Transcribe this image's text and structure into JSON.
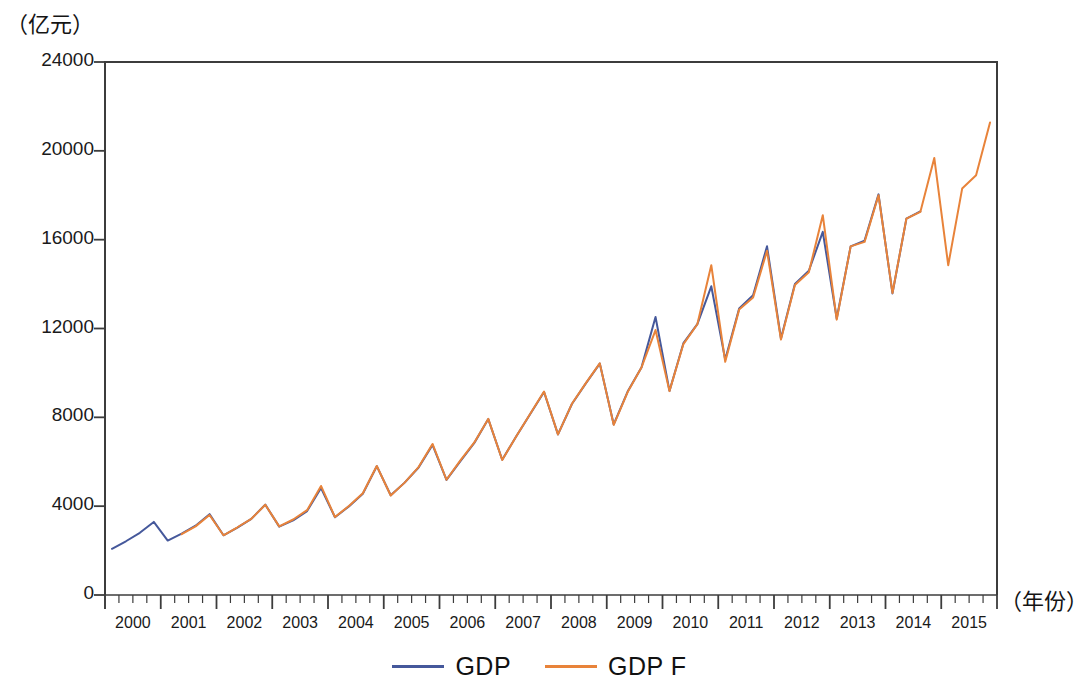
{
  "chart_data": {
    "type": "line",
    "title": "",
    "subtitle": "",
    "ylabel": "（亿元）",
    "xlabel": "（年份）",
    "ylim": [
      0,
      24000
    ],
    "yticks": [
      0,
      4000,
      8000,
      12000,
      16000,
      20000,
      24000
    ],
    "ytick_labels": [
      "0",
      "4000",
      "8000",
      "12000",
      "16000",
      "20000",
      "24000"
    ],
    "xtick_labels": [
      "2000",
      "2001",
      "2002",
      "2003",
      "2004",
      "2005",
      "2006",
      "2007",
      "2008",
      "2009",
      "2010",
      "2011",
      "2012",
      "2013",
      "2014",
      "2015"
    ],
    "x_minor_ticks_per_year": 4,
    "grid": false,
    "legend_position": "bottom-center",
    "x": [
      "2000Q1",
      "2000Q2",
      "2000Q3",
      "2000Q4",
      "2001Q1",
      "2001Q2",
      "2001Q3",
      "2001Q4",
      "2002Q1",
      "2002Q2",
      "2002Q3",
      "2002Q4",
      "2003Q1",
      "2003Q2",
      "2003Q3",
      "2003Q4",
      "2004Q1",
      "2004Q2",
      "2004Q3",
      "2004Q4",
      "2005Q1",
      "2005Q2",
      "2005Q3",
      "2005Q4",
      "2006Q1",
      "2006Q2",
      "2006Q3",
      "2006Q4",
      "2007Q1",
      "2007Q2",
      "2007Q3",
      "2007Q4",
      "2008Q1",
      "2008Q2",
      "2008Q3",
      "2008Q4",
      "2009Q1",
      "2009Q2",
      "2009Q3",
      "2009Q4",
      "2010Q1",
      "2010Q2",
      "2010Q3",
      "2010Q4",
      "2011Q1",
      "2011Q2",
      "2011Q3",
      "2011Q4",
      "2012Q1",
      "2012Q2",
      "2012Q3",
      "2012Q4",
      "2013Q1",
      "2013Q2",
      "2013Q3",
      "2013Q4",
      "2014Q1",
      "2014Q2",
      "2014Q3",
      "2014Q4",
      "2015Q1",
      "2015Q2",
      "2015Q3",
      "2015Q4"
    ],
    "series": [
      {
        "name": "GDP",
        "color": "#45589b",
        "values": [
          2080,
          2420,
          2800,
          3290,
          2450,
          2760,
          3120,
          3640,
          2690,
          3030,
          3430,
          4070,
          3080,
          3360,
          3780,
          4820,
          3500,
          3990,
          4560,
          5800,
          4490,
          5060,
          5740,
          6760,
          5180,
          6030,
          6850,
          7920,
          6090,
          7140,
          8140,
          9140,
          7230,
          8600,
          9530,
          10420,
          7680,
          9160,
          10260,
          12520,
          9190,
          11340,
          12200,
          13900,
          10600,
          12900,
          13500,
          15700,
          11550,
          14000,
          14600,
          16350,
          12450,
          15700,
          15960,
          18040,
          13580,
          16950,
          17270,
          null,
          null,
          null,
          null,
          null
        ]
      },
      {
        "name": "GDP F",
        "color": "#e8833a",
        "values": [
          null,
          null,
          null,
          null,
          null,
          2740,
          3090,
          3600,
          2690,
          3050,
          3430,
          4060,
          3090,
          3400,
          3820,
          4910,
          3510,
          4010,
          4580,
          5810,
          4480,
          5060,
          5760,
          6800,
          5190,
          6060,
          6870,
          7930,
          6080,
          7140,
          8150,
          9160,
          7230,
          8610,
          9540,
          10430,
          7660,
          9140,
          10260,
          11930,
          9180,
          11300,
          12190,
          14850,
          10500,
          12850,
          13400,
          15500,
          11500,
          13960,
          14530,
          17100,
          12400,
          15700,
          15900,
          18000,
          13600,
          16950,
          17250,
          19680,
          14850,
          18300,
          18900,
          21280
        ]
      }
    ]
  },
  "legend": {
    "items": [
      {
        "label": "GDP",
        "color": "#45589b"
      },
      {
        "label": "GDP  F",
        "color": "#e8833a"
      }
    ]
  },
  "axes": {
    "y_unit_label": "（亿元）",
    "x_unit_label": "（年份）"
  }
}
